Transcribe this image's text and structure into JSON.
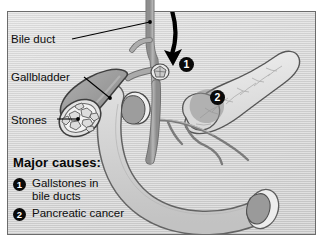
{
  "figure": {
    "background_color": "#d8d8d8",
    "frame_color": "#6c6c6c",
    "ink_color": "#0d0d0d"
  },
  "labels": {
    "bile_duct": "Bile duct",
    "gallbladder": "Gallbladder",
    "stones": "Stones"
  },
  "legend": {
    "heading": "Major causes:",
    "items": [
      {
        "number": "1",
        "text_line1": "Gallstones in",
        "text_line2": "bile ducts"
      },
      {
        "number": "2",
        "text_line1": "Pancreatic cancer",
        "text_line2": ""
      }
    ]
  },
  "markers": [
    {
      "number": "1",
      "points_to": "gallstone lodged in common bile duct"
    },
    {
      "number": "2",
      "points_to": "tumor mass in head of pancreas"
    }
  ],
  "structures": {
    "arrow": "black-curved-arrow-to-bile-duct-stone",
    "gallbladder_fill": "#9a9a9a",
    "duct_fill": "#a5a5a5",
    "pancreas_fill": "#e6e6e6",
    "duodenum_fill": "#cfcfcf",
    "stone_fill": "#efefef",
    "tumor_fill": "#8f8f8f"
  }
}
